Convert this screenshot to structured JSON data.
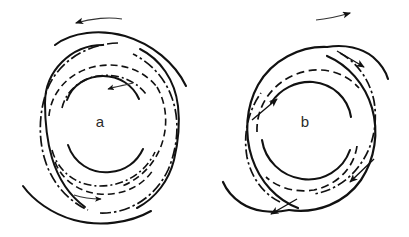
{
  "figure": {
    "title": "",
    "background_color": "#ffffff",
    "ink_color": "#111111",
    "width": 409,
    "height": 237,
    "panels": [
      {
        "id": "a",
        "label": "a",
        "label_x": 100,
        "label_y": 127,
        "center_x": 103,
        "center_y": 128,
        "rotation_sense": "counterclockwise",
        "top_arrow": {
          "name": "rotation-arrow-left",
          "direction": "left",
          "x1": 122,
          "y1": 19,
          "x2": 74,
          "y2": 23
        },
        "inner_flow_arrows": [
          {
            "name": "flow-arrow-inner-top",
            "direction": "left",
            "x1": 132,
            "y1": 84,
            "x2": 106,
            "y2": 89
          },
          {
            "name": "flow-arrow-inner-bottom",
            "direction": "right",
            "x1": 76,
            "y1": 196,
            "x2": 102,
            "y2": 199
          }
        ]
      },
      {
        "id": "b",
        "label": "b",
        "label_x": 305,
        "label_y": 127,
        "center_x": 308,
        "center_y": 128,
        "rotation_sense": "clockwise",
        "top_arrow": {
          "name": "rotation-arrow-right",
          "direction": "right",
          "x1": 318,
          "y1": 19,
          "x2": 348,
          "y2": 14
        },
        "shock_arrows": [
          {
            "name": "shock-arrow-upper-right",
            "direction": "down-right",
            "x1": 340,
            "y1": 52,
            "x2": 365,
            "y2": 67
          },
          {
            "name": "shock-arrow-left",
            "direction": "up-right",
            "x1": 253,
            "y1": 118,
            "x2": 277,
            "y2": 99
          },
          {
            "name": "shock-arrow-lower-right",
            "direction": "down-left",
            "x1": 372,
            "y1": 160,
            "x2": 350,
            "y2": 181
          },
          {
            "name": "shock-arrow-lower-left",
            "direction": "down-left",
            "x1": 295,
            "y1": 200,
            "x2": 272,
            "y2": 213
          }
        ]
      }
    ],
    "legend_note": "",
    "curve_styles": {
      "solid": "solid spiral arm",
      "dashed": "dashed spiral arm",
      "dashdot": "dash-dot spiral arm"
    }
  }
}
